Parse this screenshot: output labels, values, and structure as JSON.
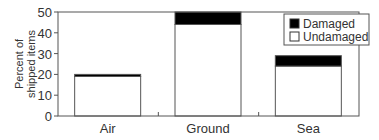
{
  "chart_data": {
    "type": "bar",
    "stacked": true,
    "title": "",
    "xlabel": "",
    "ylabel": "Percent of shipped items",
    "ylabel_lines": [
      "Percent of",
      "shipped items"
    ],
    "ylim": [
      0,
      50
    ],
    "yticks": [
      0,
      10,
      20,
      30,
      40,
      50
    ],
    "categories": [
      "Air",
      "Ground",
      "Sea"
    ],
    "series": [
      {
        "name": "Undamaged",
        "color": "#ffffff",
        "values": [
          19,
          44,
          24
        ]
      },
      {
        "name": "Damaged",
        "color": "#000000",
        "values": [
          1,
          6,
          5
        ]
      }
    ],
    "totals": [
      20,
      50,
      29
    ],
    "legend": {
      "position": "upper right",
      "entries": [
        {
          "label": "Damaged",
          "color": "#000000"
        },
        {
          "label": "Undamaged",
          "color": "#ffffff"
        }
      ]
    },
    "grid": false
  }
}
